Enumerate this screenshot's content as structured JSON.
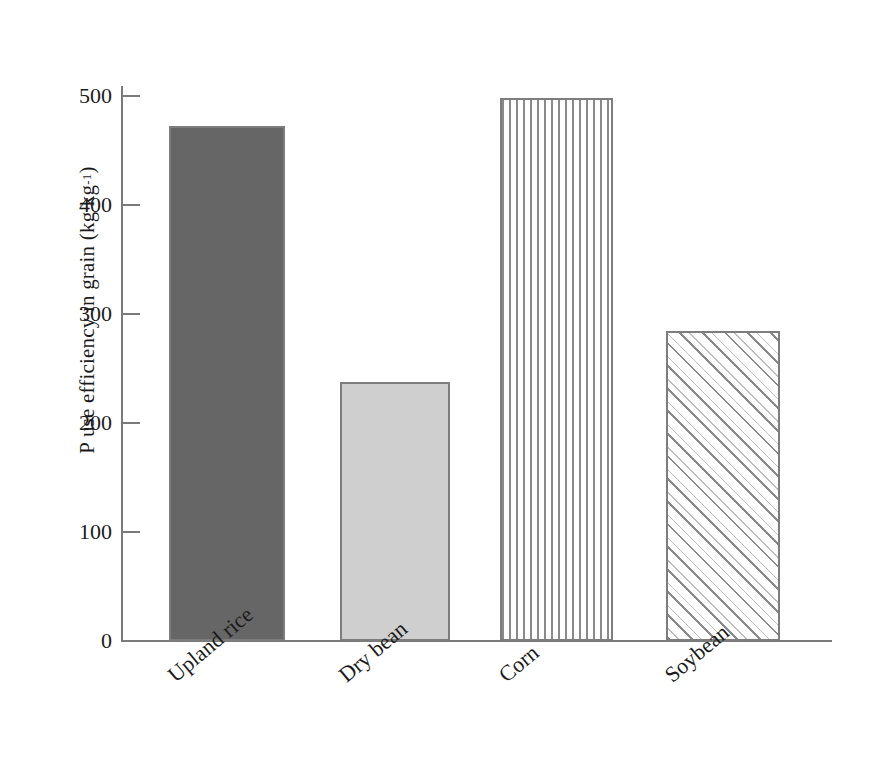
{
  "chart_data": {
    "type": "bar",
    "title": "",
    "subtitle": "",
    "xlabel": "",
    "ylabel": "P use efficiency in grain (kg kg",
    "ylabel_exponent": "-1",
    "ylabel_suffix": ")",
    "ylabel_full": "P use efficiency in grain (kg kg-1)",
    "categories": [
      "Upland rice",
      "Dry bean",
      "Corn",
      "Soybean"
    ],
    "values": [
      472,
      237,
      497,
      284
    ],
    "ylim": [
      0,
      540
    ],
    "yticks": [
      0,
      100,
      200,
      300,
      400,
      500
    ],
    "ytick_labels": [
      "0",
      "100",
      "200",
      "300",
      "400",
      "500"
    ],
    "grid": false,
    "legend": false,
    "legend_position": "none",
    "bar_fills": [
      "solid-dark-gray",
      "solid-light-gray",
      "vertical-stripes",
      "diagonal-hatch"
    ],
    "colors": {
      "bar_upland_rice": "#666666",
      "bar_dry_bean": "#cfcfcf",
      "bar_corn": "#ffffff",
      "bar_soybean": "#ffffff",
      "bar_outline": "#7d7d7d",
      "axis": "#7a7a7a",
      "text": "#1b1b1b",
      "background": "#ffffff"
    }
  }
}
